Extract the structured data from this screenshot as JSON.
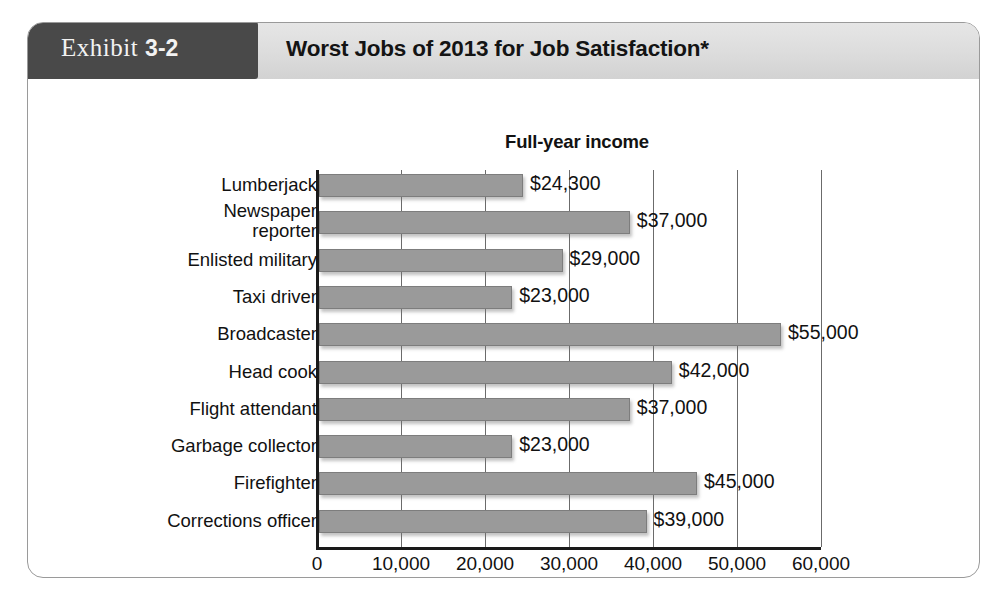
{
  "exhibit": {
    "tab_word": "Exhibit",
    "tab_number": "3-2",
    "title": "Worst Jobs of 2013 for Job Satisfaction*"
  },
  "colors": {
    "tab_background": "#494949",
    "header_background": "#dcdcdc",
    "bar_fill": "#9a9a9a",
    "bar_stroke": "#7d7d7d",
    "axis": "#1a1a1a",
    "gridline": "#6b6b6b",
    "card_border": "#9a9a9a",
    "text": "#111111"
  },
  "chart_data": {
    "type": "bar",
    "orientation": "horizontal",
    "title": "Full-year income",
    "xlabel": "",
    "ylabel": "",
    "xlim": [
      0,
      60000
    ],
    "xtick_step": 10000,
    "grid": true,
    "legend": false,
    "tick_labels": [
      "0",
      "10,000",
      "20,000",
      "30,000",
      "40,000",
      "50,000",
      "60,000"
    ],
    "ticks": [
      0,
      10000,
      20000,
      30000,
      40000,
      50000,
      60000
    ],
    "categories": [
      "Lumberjack",
      "Newspaper reporter",
      "Enlisted military",
      "Taxi driver",
      "Broadcaster",
      "Head cook",
      "Flight attendant",
      "Garbage collector",
      "Firefighter",
      "Corrections officer"
    ],
    "values": [
      24300,
      37000,
      29000,
      23000,
      55000,
      42000,
      37000,
      23000,
      45000,
      39000
    ],
    "data_labels": [
      "$24,300",
      "$37,000",
      "$29,000",
      "$23,000",
      "$55,000",
      "$42,000",
      "$37,000",
      "$23,000",
      "$45,000",
      "$39,000"
    ]
  },
  "rows": [
    {
      "label_line1": "Lumberjack",
      "label_line2": "",
      "value_label": "$24,300"
    },
    {
      "label_line1": "Newspaper",
      "label_line2": "reporter",
      "value_label": "$37,000"
    },
    {
      "label_line1": "Enlisted military",
      "label_line2": "",
      "value_label": "$29,000"
    },
    {
      "label_line1": "Taxi driver",
      "label_line2": "",
      "value_label": "$23,000"
    },
    {
      "label_line1": "Broadcaster",
      "label_line2": "",
      "value_label": "$55,000"
    },
    {
      "label_line1": "Head cook",
      "label_line2": "",
      "value_label": "$42,000"
    },
    {
      "label_line1": "Flight attendant",
      "label_line2": "",
      "value_label": "$37,000"
    },
    {
      "label_line1": "Garbage collector",
      "label_line2": "",
      "value_label": "$23,000"
    },
    {
      "label_line1": "Firefighter",
      "label_line2": "",
      "value_label": "$45,000"
    },
    {
      "label_line1": "Corrections officer",
      "label_line2": "",
      "value_label": "$39,000"
    }
  ]
}
